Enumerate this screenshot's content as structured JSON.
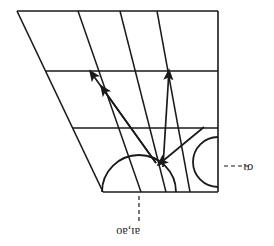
{
  "figure": {
    "title": "",
    "orientation": "inverted",
    "stroke_color": "#1a1a1a",
    "background_color": "#ffffff",
    "labels": {
      "right_label": "σı",
      "bottom_label": "aı,aᴏ"
    },
    "geometry": {
      "canvas": {
        "width": 274,
        "height": 246
      },
      "outline": {
        "top_left": [
          17,
          11
        ],
        "top_right": [
          218,
          11
        ],
        "bottom_right": [
          218,
          192
        ],
        "bottom_left": [
          103,
          192
        ]
      },
      "horizontal_grid_lines": [
        {
          "y": 71,
          "x_start": 47,
          "x_end": 218
        },
        {
          "y": 128,
          "x_start": 75,
          "x_end": 218
        }
      ],
      "slanted_lines": [
        {
          "x_top": 17,
          "x_bottom": 103
        },
        {
          "x_top": 78,
          "x_bottom": 140
        },
        {
          "x_top": 120,
          "x_bottom": 166
        },
        {
          "x_top": 157,
          "x_bottom": 190
        }
      ],
      "right_vertical": {
        "x": 218,
        "y_top": 11,
        "y_bottom": 192
      },
      "semicircle_large": {
        "cx": 139,
        "cy": 192,
        "r": 37
      },
      "semicircle_small": {
        "cx": 218,
        "cy": 162,
        "r": 25
      },
      "convergence_point": [
        156,
        163
      ],
      "arrows": [
        {
          "name": "arrow-up-left-outer",
          "from": [
            156,
            163
          ],
          "to": [
            88,
            69
          ]
        },
        {
          "name": "arrow-up-left-inner",
          "from": [
            156,
            163
          ],
          "to": [
            99,
            85
          ]
        },
        {
          "name": "arrow-up-right",
          "from": [
            162,
            166
          ],
          "to": [
            169,
            68
          ]
        },
        {
          "name": "arrow-down-converging",
          "from": [
            200,
            128
          ],
          "to": [
            157,
            164
          ]
        }
      ],
      "dashed_leaders": [
        {
          "name": "dashed-leader-right",
          "x_start": 224,
          "x_end": 248,
          "y": 166
        },
        {
          "name": "dashed-leader-bottom",
          "x": 139,
          "y_start": 196,
          "y_end": 222
        }
      ]
    }
  }
}
